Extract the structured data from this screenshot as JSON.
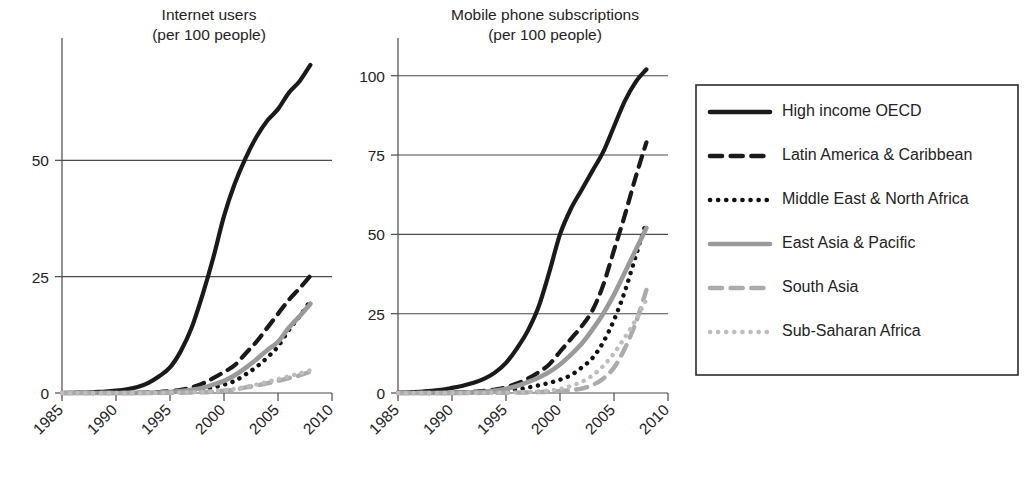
{
  "chart_data": [
    {
      "id": "internet-users",
      "type": "line",
      "title": "Internet users\n(per 100 people)",
      "title_lines": [
        "Internet users",
        "(per 100 people)"
      ],
      "xlabel": "",
      "ylabel": "",
      "xlim": [
        1985,
        2010
      ],
      "ylim": [
        0,
        75
      ],
      "xticks": [
        1985,
        1990,
        1995,
        2000,
        2005,
        2010
      ],
      "yticks": [
        0,
        25,
        50
      ],
      "grid": true,
      "grid_axis": "y",
      "x": [
        1985,
        1986,
        1987,
        1988,
        1989,
        1990,
        1991,
        1992,
        1993,
        1994,
        1995,
        1996,
        1997,
        1998,
        1999,
        2000,
        2001,
        2002,
        2003,
        2004,
        2005,
        2006,
        2007,
        2008
      ],
      "series": [
        {
          "name": "High income OECD",
          "style": "solid",
          "color": "#1a1a1a",
          "width": 4.2,
          "values": [
            0.0,
            0.05,
            0.1,
            0.2,
            0.3,
            0.5,
            0.8,
            1.3,
            2.2,
            3.6,
            5.5,
            9.0,
            14.0,
            21.0,
            29.0,
            38.0,
            45.0,
            50.5,
            55.0,
            58.5,
            61.0,
            64.5,
            67.0,
            70.5
          ]
        },
        {
          "name": "Latin America & Caribbean",
          "style": "dashed",
          "color": "#1a1a1a",
          "width": 4.2,
          "values": [
            0.0,
            0.0,
            0.0,
            0.0,
            0.0,
            0.0,
            0.02,
            0.05,
            0.1,
            0.2,
            0.4,
            0.7,
            1.2,
            2.0,
            3.2,
            4.5,
            6.0,
            8.5,
            11.0,
            14.0,
            17.0,
            20.0,
            22.5,
            25.2
          ]
        },
        {
          "name": "Middle East & North Africa",
          "style": "dotted",
          "color": "#111111",
          "width": 4.4,
          "values": [
            0.0,
            0.0,
            0.0,
            0.0,
            0.0,
            0.0,
            0.0,
            0.02,
            0.04,
            0.08,
            0.15,
            0.3,
            0.5,
            0.8,
            1.2,
            1.8,
            2.6,
            4.0,
            5.6,
            7.6,
            10.0,
            13.5,
            16.5,
            19.8
          ]
        },
        {
          "name": "East Asia & Pacific",
          "style": "solid",
          "color": "#9a9a9a",
          "width": 4.6,
          "values": [
            0.0,
            0.0,
            0.0,
            0.0,
            0.0,
            0.0,
            0.0,
            0.02,
            0.05,
            0.1,
            0.2,
            0.4,
            0.7,
            1.1,
            1.8,
            2.6,
            3.8,
            5.4,
            7.2,
            9.2,
            11.0,
            14.0,
            16.5,
            19.2
          ]
        },
        {
          "name": "South Asia",
          "style": "dashed",
          "color": "#ababab",
          "width": 4.4,
          "values": [
            0.0,
            0.0,
            0.0,
            0.0,
            0.0,
            0.0,
            0.0,
            0.0,
            0.0,
            0.01,
            0.03,
            0.05,
            0.1,
            0.15,
            0.3,
            0.5,
            0.7,
            1.2,
            1.6,
            2.1,
            2.6,
            3.2,
            3.8,
            4.6
          ]
        },
        {
          "name": "Sub-Saharan Africa",
          "style": "dotted",
          "color": "#bdbdbd",
          "width": 4.4,
          "values": [
            0.0,
            0.0,
            0.0,
            0.0,
            0.0,
            0.0,
            0.0,
            0.0,
            0.01,
            0.02,
            0.04,
            0.08,
            0.15,
            0.25,
            0.4,
            0.6,
            0.9,
            1.3,
            1.8,
            2.4,
            3.0,
            3.6,
            4.2,
            4.9
          ]
        }
      ]
    },
    {
      "id": "mobile-phone-subscriptions",
      "type": "line",
      "title": "Mobile phone subscriptions\n(per 100 people)",
      "title_lines": [
        "Mobile phone subscriptions",
        "(per 100 people)"
      ],
      "xlabel": "",
      "ylabel": "",
      "xlim": [
        1985,
        2010
      ],
      "ylim": [
        0,
        110
      ],
      "xticks": [
        1985,
        1990,
        1995,
        2000,
        2005,
        2010
      ],
      "yticks": [
        0,
        25,
        50,
        75,
        100
      ],
      "grid": true,
      "grid_axis": "y",
      "x": [
        1985,
        1986,
        1987,
        1988,
        1989,
        1990,
        1991,
        1992,
        1993,
        1994,
        1995,
        1996,
        1997,
        1998,
        1999,
        2000,
        2001,
        2002,
        2003,
        2004,
        2005,
        2006,
        2007,
        2008
      ],
      "series": [
        {
          "name": "High income OECD",
          "style": "solid",
          "color": "#1a1a1a",
          "width": 4.2,
          "values": [
            0.1,
            0.2,
            0.4,
            0.7,
            1.0,
            1.6,
            2.3,
            3.2,
            4.5,
            6.5,
            9.5,
            14.0,
            19.5,
            27.0,
            38.0,
            50.0,
            58.0,
            64.0,
            70.0,
            76.0,
            84.0,
            92.0,
            98.0,
            102.0
          ]
        },
        {
          "name": "Latin America & Caribbean",
          "style": "dashed",
          "color": "#1a1a1a",
          "width": 4.2,
          "values": [
            0.0,
            0.0,
            0.0,
            0.0,
            0.02,
            0.1,
            0.2,
            0.4,
            0.7,
            1.1,
            1.8,
            3.0,
            4.5,
            6.5,
            9.0,
            13.0,
            17.0,
            21.0,
            26.0,
            34.0,
            45.0,
            56.0,
            68.0,
            79.0
          ]
        },
        {
          "name": "Middle East & North Africa",
          "style": "dotted",
          "color": "#111111",
          "width": 4.4,
          "values": [
            0.0,
            0.0,
            0.0,
            0.0,
            0.0,
            0.02,
            0.05,
            0.1,
            0.2,
            0.4,
            0.7,
            1.1,
            1.7,
            2.4,
            3.2,
            4.2,
            5.6,
            8.0,
            11.0,
            16.0,
            23.0,
            32.0,
            43.0,
            54.0
          ]
        },
        {
          "name": "East Asia & Pacific",
          "style": "solid",
          "color": "#9a9a9a",
          "width": 4.6,
          "values": [
            0.0,
            0.0,
            0.0,
            0.0,
            0.02,
            0.05,
            0.1,
            0.2,
            0.4,
            0.8,
            1.3,
            2.2,
            3.4,
            4.8,
            6.6,
            9.0,
            12.0,
            15.5,
            20.0,
            25.0,
            31.0,
            38.0,
            45.0,
            52.0
          ]
        },
        {
          "name": "South Asia",
          "style": "dashed",
          "color": "#ababab",
          "width": 4.4,
          "values": [
            0.0,
            0.0,
            0.0,
            0.0,
            0.0,
            0.0,
            0.0,
            0.02,
            0.03,
            0.05,
            0.08,
            0.12,
            0.2,
            0.3,
            0.4,
            0.6,
            0.9,
            1.4,
            2.5,
            4.5,
            8.0,
            14.0,
            22.0,
            32.5
          ]
        },
        {
          "name": "Sub-Saharan Africa",
          "style": "dotted",
          "color": "#bdbdbd",
          "width": 4.4,
          "values": [
            0.0,
            0.0,
            0.0,
            0.0,
            0.0,
            0.0,
            0.01,
            0.02,
            0.04,
            0.07,
            0.1,
            0.2,
            0.3,
            0.5,
            0.8,
            1.3,
            2.2,
            3.5,
            5.5,
            8.5,
            12.5,
            17.5,
            23.0,
            29.5
          ]
        }
      ]
    }
  ],
  "legend": {
    "position": "right",
    "entries": [
      {
        "label": "High income OECD",
        "style": "solid",
        "color": "#1a1a1a"
      },
      {
        "label": "Latin America & Caribbean",
        "style": "dashed",
        "color": "#1a1a1a"
      },
      {
        "label": "Middle East & North Africa",
        "style": "dotted",
        "color": "#111111"
      },
      {
        "label": "East Asia & Pacific",
        "style": "solid",
        "color": "#9a9a9a"
      },
      {
        "label": "South Asia",
        "style": "dashed",
        "color": "#ababab"
      },
      {
        "label": "Sub-Saharan Africa",
        "style": "dotted",
        "color": "#bdbdbd"
      }
    ]
  }
}
